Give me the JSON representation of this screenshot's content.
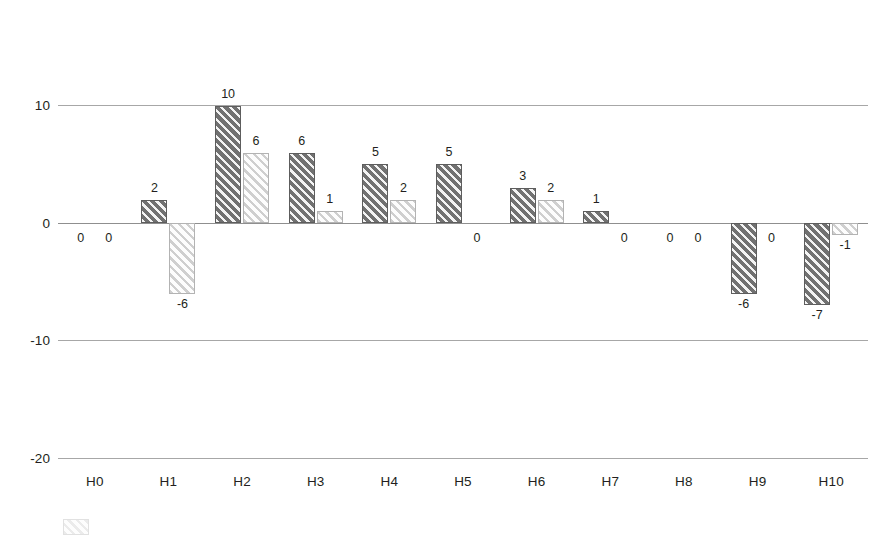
{
  "chart_data": {
    "type": "bar",
    "title": "",
    "subtitle": "",
    "xlabel": "",
    "ylabel": "",
    "categories": [
      "H0",
      "H1",
      "H2",
      "H3",
      "H4",
      "H5",
      "H6",
      "H7",
      "H8",
      "H9",
      "H10"
    ],
    "series": [
      {
        "name": "Series 1",
        "style": "dark-hatched",
        "color": "#717171",
        "values": [
          0,
          2,
          10,
          6,
          5,
          5,
          3,
          1,
          0,
          -6,
          -7
        ]
      },
      {
        "name": "Series 2",
        "style": "light-hatched",
        "color": "#fdfdfd",
        "values": [
          0,
          -6,
          6,
          1,
          2,
          0,
          2,
          0,
          0,
          0,
          -1
        ]
      }
    ],
    "ylim": [
      -20,
      10
    ],
    "yticks": [
      10,
      0,
      -10,
      -20
    ],
    "ytick_labels": [
      "10",
      "0",
      "-10",
      "-20"
    ],
    "grid": true,
    "grid_axis": "y",
    "legend_position": "bottom-left",
    "data_labels": true,
    "data_label_text": [
      [
        "0",
        "0"
      ],
      [
        "2",
        "-6"
      ],
      [
        "10",
        "6"
      ],
      [
        "6",
        "1"
      ],
      [
        "5",
        "2"
      ],
      [
        "5",
        "0"
      ],
      [
        "3",
        "2"
      ],
      [
        "1",
        "0"
      ],
      [
        "0",
        "0"
      ],
      [
        "-6",
        "0"
      ],
      [
        "-7",
        "-1"
      ]
    ]
  },
  "axis": {
    "y_ticks": [
      "10",
      "0",
      "-10",
      "-20"
    ],
    "x_ticks": [
      "H0",
      "H1",
      "H2",
      "H3",
      "H4",
      "H5",
      "H6",
      "H7",
      "H8",
      "H9",
      "H10"
    ]
  },
  "legend": {
    "items": [
      {
        "label": ""
      }
    ]
  },
  "colors": {
    "series_dark": "#717171",
    "series_light": "#fdfdfd",
    "gridline": "#a7a7a7",
    "zero_line": "#8f8f8f",
    "text": "#231f20",
    "background": "#ffffff"
  }
}
